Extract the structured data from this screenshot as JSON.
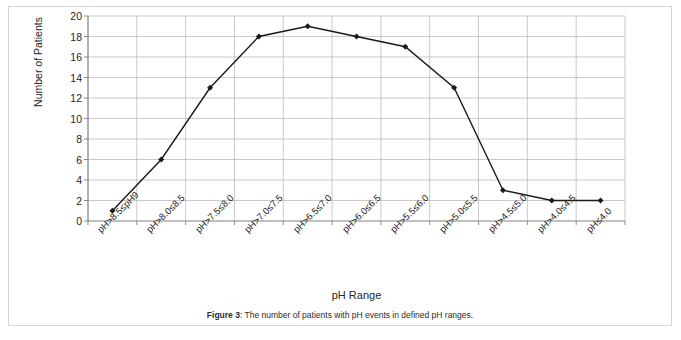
{
  "figure": {
    "caption_label": "Figure 3",
    "caption_separator": ": ",
    "caption_text": "The number of patients with pH events in defined pH ranges."
  },
  "chart_data": {
    "type": "line",
    "title": "",
    "xlabel": "pH Range",
    "ylabel": "Number of Patients",
    "categories": [
      "pH>8.5≤pH9",
      "pH>8.0≤8.5",
      "pH>7.5≤8.0",
      "pH>7.0≤7.5",
      "pH>6.5≤7.0",
      "pH>6.0≤6.5",
      "pH>5.5≤6.0",
      "pH>5.0≤5.5",
      "pH>4.5≤5.0",
      "pH>4.0≤4.5",
      "pH≤4.0"
    ],
    "values": [
      1,
      6,
      13,
      18,
      19,
      18,
      17,
      13,
      3,
      2,
      2
    ],
    "ylim": [
      0,
      20
    ],
    "ytick_step": 2,
    "yticks": [
      0,
      2,
      4,
      6,
      8,
      10,
      12,
      14,
      16,
      18,
      20
    ],
    "ytick_labels": [
      "0",
      "2",
      "4",
      "6",
      "8",
      "10",
      "12",
      "14",
      "16",
      "18",
      "20"
    ],
    "grid": "both",
    "legend": "none",
    "marker": "diamond",
    "series_color": "#1a1a1a",
    "grid_color": "#b3b3b3",
    "axis_color": "#808080",
    "background": "#ffffff"
  }
}
